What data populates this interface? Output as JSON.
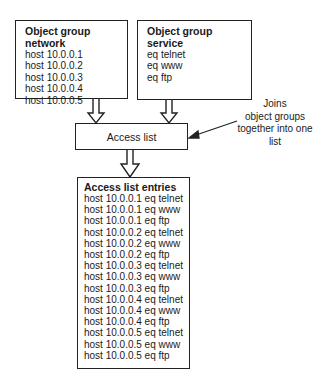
{
  "network_group": {
    "title": "Object group network",
    "items": [
      "host 10.0.0.1",
      "host 10.0.0.2",
      "host 10.0.0.3",
      "host 10.0.0.4",
      "host 10.0.0.5"
    ]
  },
  "service_group": {
    "title": "Object group service",
    "items": [
      "eq telnet",
      "eq www",
      "eq ftp"
    ]
  },
  "access_list": {
    "label": "Access list"
  },
  "annotation": {
    "lines": [
      "Joins",
      "object groups",
      "together into one",
      "list"
    ]
  },
  "entries": {
    "title": "Access list entries",
    "items": [
      "host 10.0.0.1 eq telnet",
      "host 10.0.0.1 eq www",
      "host 10.0.0.1 eq ftp",
      "host 10.0.0.2 eq telnet",
      "host 10.0.0.2 eq www",
      "host 10.0.0.2 eq ftp",
      "host 10.0.0.3 eq telnet",
      "host 10.0.0.3 eq www",
      "host 10.0.0.3 eq ftp",
      "host 10.0.0.4 eq telnet",
      "host 10.0.0.4 eq www",
      "host 10.0.0.4 eq ftp",
      "host 10.0.0.5 eq telnet",
      "host 10.0.0.5 eq www",
      "host 10.0.0.5 eq ftp"
    ]
  }
}
